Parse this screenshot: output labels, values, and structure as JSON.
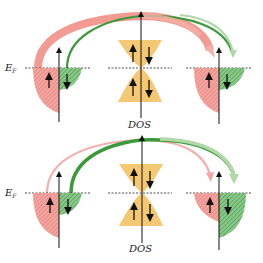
{
  "panels": [
    {
      "id": "top",
      "fermi_label": "E",
      "fermi_sub": "F",
      "dos_label": "DOS",
      "left_lobes": {
        "spin_up_size": "large",
        "spin_down_size": "small"
      },
      "right_lobes": {
        "spin_up_size": "large",
        "spin_down_size": "small"
      },
      "arrow_style": {
        "red": "thick",
        "green": "thin-faded"
      }
    },
    {
      "id": "bottom",
      "fermi_label": "E",
      "fermi_sub": "F",
      "dos_label": "DOS",
      "left_lobes": {
        "spin_up_size": "large",
        "spin_down_size": "small"
      },
      "right_lobes": {
        "spin_up_size": "small",
        "spin_down_size": "large"
      },
      "arrow_style": {
        "red": "thin-faded",
        "green": "thick"
      }
    }
  ],
  "colors": {
    "spin_up": "#f08080",
    "spin_down": "#3a9a3a",
    "barrier": "#f5c060",
    "axis": "#111111"
  }
}
